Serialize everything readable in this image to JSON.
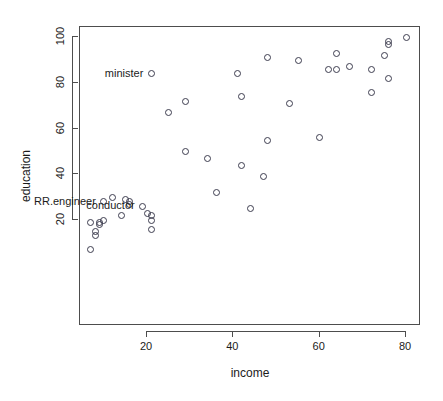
{
  "chart_data": {
    "type": "scatter",
    "title": "",
    "xlabel": "income",
    "ylabel": "education",
    "xlim": [
      2,
      81
    ],
    "ylim": [
      5,
      102
    ],
    "xticks": [
      20,
      40,
      60,
      80
    ],
    "yticks": [
      20,
      40,
      60,
      80,
      100
    ],
    "grid": false,
    "legend": false,
    "marker": "open-circle",
    "series": [
      {
        "name": "occupations",
        "x": [
          62,
          72,
          75,
          55,
          64,
          21,
          64,
          80,
          67,
          72,
          42,
          76,
          76,
          41,
          48,
          76,
          53,
          60,
          42,
          29,
          29,
          25,
          44,
          48,
          47,
          34,
          36,
          21,
          21,
          20,
          16,
          14,
          16,
          15,
          12,
          9,
          10,
          7,
          8,
          7,
          9,
          8,
          19,
          21,
          10
        ],
        "y": [
          86,
          76,
          92,
          90,
          86,
          84,
          93,
          100,
          87,
          86,
          74,
          98,
          97,
          84,
          91,
          82,
          71,
          56,
          44,
          72,
          50,
          67,
          25,
          55,
          39,
          47,
          32,
          20,
          22,
          23,
          28,
          22,
          27,
          29,
          30,
          18,
          20,
          19,
          15,
          7,
          19,
          13,
          26,
          16,
          28
        ],
        "labels": [
          "",
          "",
          "",
          "",
          "",
          "minister",
          "",
          "",
          "",
          "",
          "",
          "",
          "",
          "",
          "",
          "",
          "",
          "",
          "",
          "",
          "",
          "",
          "",
          "",
          "",
          "",
          "",
          "",
          "",
          "",
          "",
          "",
          "",
          "",
          "",
          "",
          "",
          "",
          "",
          "",
          "",
          "",
          "conductor",
          "",
          "RR.engineer"
        ]
      }
    ]
  },
  "annotations": [
    {
      "text": "minister",
      "x": 21,
      "y": 84
    },
    {
      "text": "conductor",
      "x": 19,
      "y": 26
    },
    {
      "text": "RR.engineer",
      "x": 10,
      "y": 28
    }
  ],
  "figure": {
    "background": "#ffffff",
    "axis_color": "#4d4d4d",
    "point_color": "#3d3d4f",
    "text_color": "#1b1b1b"
  }
}
